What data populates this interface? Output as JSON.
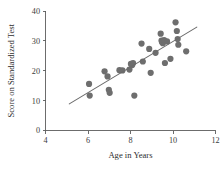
{
  "chart_data": {
    "type": "scatter",
    "title": "",
    "xlabel": "Age in Years",
    "ylabel": "Score on Standardized Test",
    "xlim": [
      4,
      12
    ],
    "ylim": [
      0,
      40
    ],
    "xticks": [
      4,
      6,
      8,
      10,
      12
    ],
    "yticks": [
      0,
      10,
      20,
      30,
      40
    ],
    "xtick_labels": [
      "4",
      "6",
      "8",
      "10",
      "12"
    ],
    "ytick_labels": [
      "0",
      "10",
      "20",
      "30",
      "40"
    ],
    "grid": false,
    "legend": false,
    "legend_position": "none",
    "point_color": "#6e6e6e",
    "line_color": "#6a6a6a",
    "axis_color": "#5c5c5c",
    "text_color": "#2e2e2e",
    "background_color": "#ffffff",
    "marker": "circle",
    "marker_size": 3.1,
    "points": [
      {
        "x": 6.05,
        "y": 15.6
      },
      {
        "x": 6.08,
        "y": 11.7
      },
      {
        "x": 6.78,
        "y": 19.8
      },
      {
        "x": 6.92,
        "y": 18.1
      },
      {
        "x": 6.98,
        "y": 13.6
      },
      {
        "x": 7.02,
        "y": 12.6
      },
      {
        "x": 7.48,
        "y": 20.2
      },
      {
        "x": 7.62,
        "y": 20.1
      },
      {
        "x": 7.95,
        "y": 20.4
      },
      {
        "x": 8.02,
        "y": 22.3
      },
      {
        "x": 8.08,
        "y": 21.9
      },
      {
        "x": 8.12,
        "y": 22.6
      },
      {
        "x": 8.18,
        "y": 11.7
      },
      {
        "x": 8.52,
        "y": 29.1
      },
      {
        "x": 8.58,
        "y": 23.1
      },
      {
        "x": 8.88,
        "y": 27.3
      },
      {
        "x": 8.95,
        "y": 19.3
      },
      {
        "x": 9.18,
        "y": 26.0
      },
      {
        "x": 9.42,
        "y": 32.4
      },
      {
        "x": 9.46,
        "y": 30.1
      },
      {
        "x": 9.48,
        "y": 29.6
      },
      {
        "x": 9.52,
        "y": 29.2
      },
      {
        "x": 9.58,
        "y": 30.3
      },
      {
        "x": 9.62,
        "y": 22.6
      },
      {
        "x": 9.72,
        "y": 29.8
      },
      {
        "x": 9.88,
        "y": 24.0
      },
      {
        "x": 10.12,
        "y": 36.2
      },
      {
        "x": 10.18,
        "y": 33.3
      },
      {
        "x": 10.22,
        "y": 30.6
      },
      {
        "x": 10.25,
        "y": 28.7
      },
      {
        "x": 10.62,
        "y": 26.5
      }
    ],
    "fit_line": {
      "x_start": 5.12,
      "y_start": 8.9,
      "x_end": 11.12,
      "y_end": 34.6
    }
  }
}
